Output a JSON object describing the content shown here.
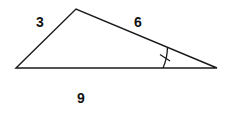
{
  "diagram": {
    "type": "triangle",
    "vertices": {
      "left": [
        16,
        68
      ],
      "top": [
        76,
        9
      ],
      "right": [
        217,
        68
      ]
    },
    "sides": [
      {
        "name": "left-side",
        "label": "3"
      },
      {
        "name": "top-side",
        "label": "6"
      },
      {
        "name": "base",
        "label": "9"
      }
    ],
    "angle_marker": {
      "vertex": "right",
      "marks": 1
    },
    "stroke_color": "#1a1a1a"
  }
}
